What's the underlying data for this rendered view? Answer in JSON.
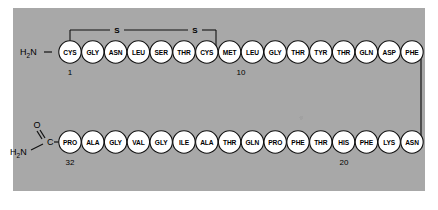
{
  "figure": {
    "panel_color": "#a8a8a8",
    "circle_fill": "#ffffff",
    "line_color": "#111111"
  },
  "termini": {
    "n_terminus": {
      "main": "H",
      "sub": "2",
      "tail": "N"
    },
    "c_terminus": {
      "o_label": "O",
      "c_label": "C",
      "main": "H",
      "sub": "2",
      "tail": "N"
    }
  },
  "disulfide": {
    "label_left": "S",
    "label_right": "S",
    "from_residue": "CYS",
    "to_residue": "CYS"
  },
  "numbers": {
    "start": "1",
    "ten": "10",
    "twenty": "20",
    "thirtytwo": "32"
  },
  "top_row": {
    "residues": [
      {
        "name": "CYS",
        "number": 1
      },
      {
        "name": "GLY",
        "number": 2
      },
      {
        "name": "ASN",
        "number": 3
      },
      {
        "name": "LEU",
        "number": 4
      },
      {
        "name": "SER",
        "number": 5
      },
      {
        "name": "THR",
        "number": 6
      },
      {
        "name": "CYS",
        "number": 7
      },
      {
        "name": "MET",
        "number": 8
      },
      {
        "name": "LEU",
        "number": 9
      },
      {
        "name": "GLY",
        "number": 10
      },
      {
        "name": "THR",
        "number": 11
      },
      {
        "name": "TYR",
        "number": 12
      },
      {
        "name": "THR",
        "number": 13
      },
      {
        "name": "GLN",
        "number": 14
      },
      {
        "name": "ASP",
        "number": 15
      },
      {
        "name": "PHE",
        "number": 16
      }
    ]
  },
  "bottom_row": {
    "residues": [
      {
        "name": "PRO",
        "number": 32
      },
      {
        "name": "ALA",
        "number": 31
      },
      {
        "name": "GLY",
        "number": 30
      },
      {
        "name": "VAL",
        "number": 29
      },
      {
        "name": "GLY",
        "number": 28
      },
      {
        "name": "ILE",
        "number": 27
      },
      {
        "name": "ALA",
        "number": 26
      },
      {
        "name": "THR",
        "number": 25
      },
      {
        "name": "GLN",
        "number": 24
      },
      {
        "name": "PRO",
        "number": 23
      },
      {
        "name": "PHE",
        "number": 22
      },
      {
        "name": "THR",
        "number": 21
      },
      {
        "name": "HIS",
        "number": 20
      },
      {
        "name": "PHE",
        "number": 19
      },
      {
        "name": "LYS",
        "number": 18
      },
      {
        "name": "ASN",
        "number": 17
      }
    ]
  }
}
